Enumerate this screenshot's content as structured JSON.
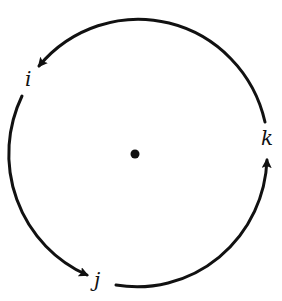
{
  "diagram": {
    "type": "cyclic-permutation-circle",
    "stroke_color": "#111111",
    "background": "#ffffff",
    "center_point": {
      "label": "",
      "x": 135,
      "y": 154
    },
    "nodes": [
      {
        "id": "i",
        "label": "i"
      },
      {
        "id": "j",
        "label": "j"
      },
      {
        "id": "k",
        "label": "k"
      }
    ],
    "arrows": [
      {
        "from": "k",
        "to": "i",
        "direction": "counterclockwise"
      },
      {
        "from": "i",
        "to": "j",
        "direction": "counterclockwise"
      },
      {
        "from": "j",
        "to": "k",
        "direction": "counterclockwise"
      }
    ]
  }
}
